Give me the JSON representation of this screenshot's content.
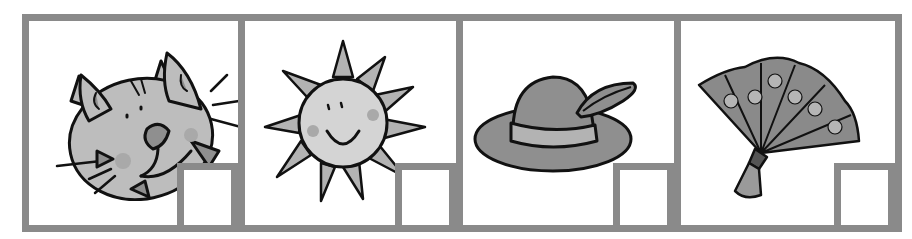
{
  "worksheet": {
    "border_color": "#8a8a8a",
    "panels": [
      {
        "label": "cat",
        "icon": "cat-face-icon"
      },
      {
        "label": "sun",
        "icon": "sun-icon"
      },
      {
        "label": "hat",
        "icon": "feathered-hat-icon"
      },
      {
        "label": "fan",
        "icon": "hand-fan-icon"
      }
    ]
  }
}
